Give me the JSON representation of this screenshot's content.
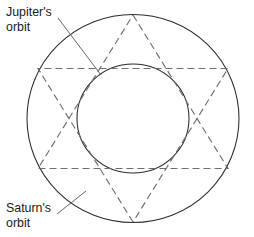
{
  "figure": {
    "type": "geometric-diagram",
    "background_color": "#ffffff",
    "width": 254,
    "height": 237
  },
  "labels": {
    "jupiter": {
      "line1": "Jupiter's",
      "line2": "orbit",
      "x": 6,
      "y": 16
    },
    "saturn": {
      "line1": "Saturn's",
      "line2": "orbit",
      "x": 6,
      "y": 212
    }
  },
  "orbits": {
    "saturn": {
      "name": "Saturn's orbit",
      "shape": "ellipse",
      "cx": 133,
      "cy": 118.5,
      "rx": 106,
      "ry": 104,
      "stroke": "#2b2b2b",
      "style": "solid"
    },
    "jupiter": {
      "name": "Jupiter's orbit",
      "shape": "ellipse",
      "cx": 133,
      "cy": 118.5,
      "rx": 56,
      "ry": 54.5,
      "stroke": "#2b2b2b",
      "style": "solid"
    }
  },
  "conjunction_figure": {
    "name": "hexagram",
    "style": "dashed",
    "stroke": "#6e6e72",
    "dash_pattern": "7 4",
    "triangle_up": [
      [
        133,
        15
      ],
      [
        228,
        168.5
      ],
      [
        38,
        168.5
      ]
    ],
    "triangle_down": [
      [
        133,
        222
      ],
      [
        38,
        68.5
      ],
      [
        228,
        68.5
      ]
    ]
  },
  "leaders": {
    "jupiter_leader": {
      "from": [
        58,
        18
      ],
      "to": [
        100,
        74
      ]
    },
    "saturn_leader": {
      "from": [
        57,
        214
      ],
      "to": [
        86,
        192
      ]
    }
  }
}
